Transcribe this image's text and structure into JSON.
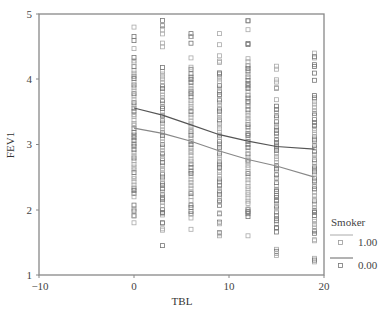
{
  "chart_data": {
    "type": "scatter",
    "title": "",
    "xlabel": "TBL",
    "ylabel": "FEV1",
    "xlim": [
      -10,
      20
    ],
    "ylim": [
      1,
      5
    ],
    "xticks": [
      -10,
      0,
      10,
      20
    ],
    "yticks": [
      1,
      2,
      3,
      4,
      5
    ],
    "grid": false,
    "legend": {
      "title": "Smoker",
      "position": "right-bottom",
      "entries": [
        "1.00",
        "0.00"
      ]
    },
    "x_columns": [
      0,
      3,
      6,
      9,
      12,
      15,
      19
    ],
    "scatter_ranges": [
      {
        "x": 0,
        "min": 1.8,
        "max": 4.8
      },
      {
        "x": 3,
        "min": 1.45,
        "max": 4.9
      },
      {
        "x": 6,
        "min": 1.7,
        "max": 4.7
      },
      {
        "x": 9,
        "min": 1.6,
        "max": 4.7
      },
      {
        "x": 12,
        "min": 1.6,
        "max": 4.9
      },
      {
        "x": 15,
        "min": 1.3,
        "max": 4.2
      },
      {
        "x": 19,
        "min": 1.2,
        "max": 4.4
      }
    ],
    "series": [
      {
        "name": "0.00",
        "kind": "fit-line",
        "x": [
          0,
          3,
          6,
          9,
          12,
          15,
          19
        ],
        "values": [
          3.56,
          3.45,
          3.3,
          3.15,
          3.05,
          2.97,
          2.93
        ]
      },
      {
        "name": "1.00",
        "kind": "fit-line",
        "x": [
          0,
          3,
          6,
          9,
          12,
          15,
          19
        ],
        "values": [
          3.25,
          3.17,
          3.05,
          2.9,
          2.77,
          2.67,
          2.5
        ]
      }
    ]
  },
  "labels": {
    "xlabel": "TBL",
    "ylabel": "FEV1",
    "legend_title": "Smoker",
    "legend_1": "1.00",
    "legend_0": "0.00",
    "xt0": "−10",
    "xt1": "0",
    "xt2": "10",
    "xt3": "20",
    "yt1": "1",
    "yt2": "2",
    "yt3": "3",
    "yt4": "4",
    "yt5": "5"
  }
}
